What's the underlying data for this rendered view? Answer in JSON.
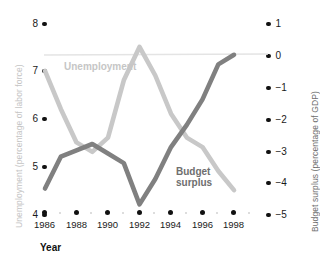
{
  "chart_data": {
    "type": "line",
    "title": "",
    "xlabel": "Year",
    "x": [
      1986,
      1987,
      1988,
      1989,
      1990,
      1991,
      1992,
      1993,
      1994,
      1995,
      1996,
      1997,
      1998
    ],
    "grid": false,
    "legend_position": "inline-annotations",
    "series": [
      {
        "name": "Unemployment",
        "axis": "left",
        "color": "#c8c8c8",
        "ylabel": "Unemployment (percentage of labor force)",
        "ylim": [
          4,
          8
        ],
        "yticks": [
          8,
          7,
          6,
          5,
          4
        ],
        "values": [
          7.0,
          6.2,
          5.5,
          5.3,
          5.6,
          6.8,
          7.5,
          6.9,
          6.1,
          5.6,
          5.4,
          4.9,
          4.5
        ]
      },
      {
        "name": "Budget surplus",
        "axis": "right",
        "color": "#808080",
        "ylabel": "Budget surplus (percentage of GDP)",
        "ylim": [
          -5,
          1
        ],
        "yticks": [
          1,
          0,
          -1,
          -2,
          -3,
          -4,
          -5
        ],
        "values": [
          -4.2,
          -3.2,
          -3.0,
          -2.8,
          -3.1,
          -3.4,
          -4.7,
          -3.9,
          -2.9,
          -2.2,
          -1.4,
          -0.3,
          0.0
        ]
      }
    ]
  },
  "axes": {
    "left": {
      "title": "Unemployment (percentage of labor force)",
      "ticks": [
        "8",
        "7",
        "6",
        "5",
        "4"
      ]
    },
    "right": {
      "title": "Budget surplus (percentage of GDP)",
      "ticks": [
        "1",
        "0",
        "−1",
        "−2",
        "−3",
        "−4",
        "−5"
      ]
    },
    "bottom": {
      "title": "Year",
      "ticks": [
        "1986",
        "1988",
        "1990",
        "1992",
        "1994",
        "1996",
        "1998"
      ]
    }
  },
  "annotations": {
    "unemployment": "Unemployment",
    "budget_line1": "Budget",
    "budget_line2": "surplus"
  },
  "colors": {
    "unemployment": "#c8c8c8",
    "budget": "#808080",
    "tick": "#111111",
    "zero_line": "#e2e2e2"
  }
}
